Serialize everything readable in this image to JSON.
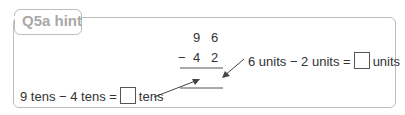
{
  "hint": {
    "title": "Q5a hint"
  },
  "calculation": {
    "top_tens": "9",
    "top_units": "6",
    "operator": "−",
    "bottom_tens": "4",
    "bottom_units": "2"
  },
  "units_hint": {
    "part1": "6 units − 2 units =",
    "part2": "units"
  },
  "tens_hint": {
    "part1": "9 tens − 4 tens =",
    "part2": "tens"
  },
  "colors": {
    "border": "#bdbdbd",
    "title": "#a8a8a8",
    "text": "#333333"
  }
}
